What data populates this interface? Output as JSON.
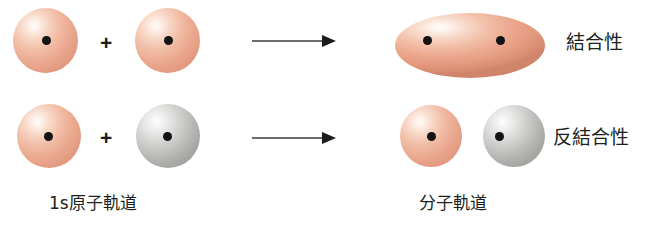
{
  "figure": {
    "width": 653,
    "height": 241,
    "background": "#ffffff"
  },
  "colors": {
    "pink_orbital": "#eaa88e",
    "gray_orbital": "#b4b4b2",
    "nucleus": "#131313",
    "text": "#201f1d",
    "arrow": "#3a3a3a"
  },
  "symbols": {
    "plus": "+",
    "arrow": "arrow-right"
  },
  "rows": [
    {
      "id": "bonding",
      "left_orbital_1": {
        "type": "sphere",
        "color": "pink"
      },
      "operator": "+",
      "left_orbital_2": {
        "type": "sphere",
        "color": "pink"
      },
      "arrow": "arrow-right",
      "result": {
        "type": "ellipse",
        "color": "pink",
        "nuclei": 2
      },
      "label": "結合性"
    },
    {
      "id": "antibonding",
      "left_orbital_1": {
        "type": "sphere",
        "color": "pink"
      },
      "operator": "+",
      "left_orbital_2": {
        "type": "sphere",
        "color": "gray"
      },
      "arrow": "arrow-right",
      "result": {
        "type": "sphere-pair",
        "colors": "pink,gray",
        "nuclei": 2
      },
      "label": "反結合性"
    }
  ],
  "captions": {
    "left": "1s原子軌道",
    "right": "分子軌道"
  }
}
